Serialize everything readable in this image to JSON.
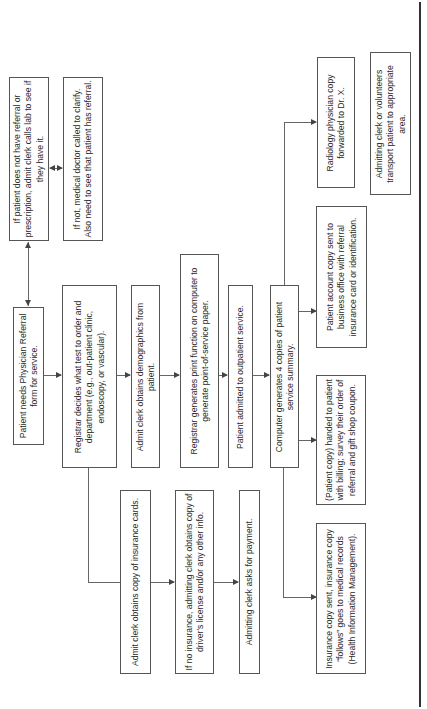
{
  "diagram": {
    "orientation": "rotated-90-ccw",
    "nodes": {
      "lab_call": "If patient does not have referral or prescription, admit clerk calls lab to see if they have it.",
      "doctor_clarify": "If not, medical doctor called to clarify. Also need to see that patient has referral.",
      "needs_referral": "Patient needs Physician Referral form for service.",
      "registrar_decides": "Registrar decides what test to order and department (e.g., out-patient clinic, endoscopy, or vascular).",
      "demographics": "Admit clerk obtains demographics from patient.",
      "print_function": "Registrar generates print function on computer to generate point-of-service paper.",
      "admitted": "Patient admitted to outpatient service.",
      "four_copies": "Computer generates 4 copies of patient service summary.",
      "insurance_cards": "Admit clerk obtains copy of insurance cards.",
      "no_insurance": "If no insurance, admitting clerk obtains copy of driver's license and/or any other info.",
      "asks_payment": "Admitting clerk asks for payment.",
      "insurance_copy": "Insurance copy sent, insurance copy “follows” goes to medical records (Health Information Management).",
      "patient_copy": "(Patient copy) handed to patient with billing; survey their order of referral and gift shop coupon.",
      "account_copy": "Patient account copy sent to business office with referral insurance card or identification.",
      "radiology_copy": "Radiology physician copy forwarded to Dr. X.",
      "transport": "Admitting clerk or volunteers transport patient to appropriate area."
    },
    "edges": [
      [
        "needs_referral",
        "lab_call",
        "bidirectional"
      ],
      [
        "lab_call",
        "doctor_clarify",
        "bidirectional"
      ],
      [
        "needs_referral",
        "registrar_decides"
      ],
      [
        "registrar_decides",
        "demographics"
      ],
      [
        "demographics",
        "print_function"
      ],
      [
        "print_function",
        "admitted"
      ],
      [
        "admitted",
        "four_copies"
      ],
      [
        "registrar_decides",
        "insurance_cards"
      ],
      [
        "insurance_cards",
        "no_insurance"
      ],
      [
        "no_insurance",
        "asks_payment"
      ],
      [
        "four_copies",
        "insurance_copy"
      ],
      [
        "four_copies",
        "patient_copy"
      ],
      [
        "four_copies",
        "account_copy"
      ],
      [
        "four_copies",
        "radiology_copy"
      ]
    ]
  }
}
